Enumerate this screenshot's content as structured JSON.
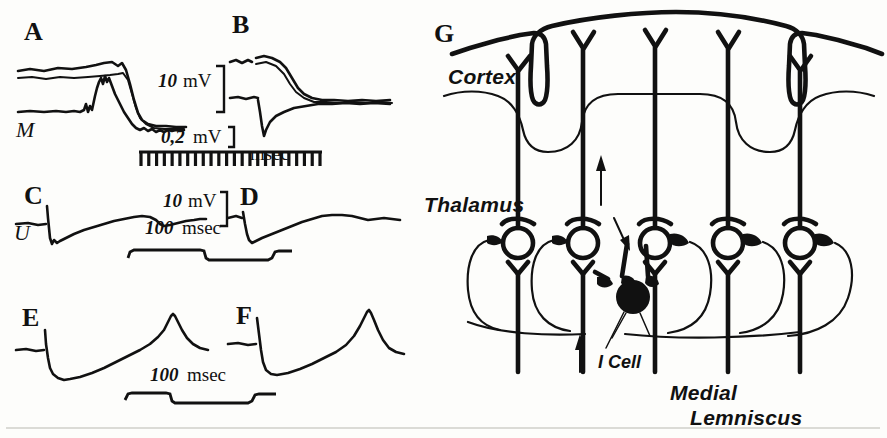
{
  "figure": {
    "kind": "electrophysiology-figure",
    "background_color": "#fdfdfb",
    "ink_color": "#111111"
  },
  "panels": {
    "a": {
      "letter": "A",
      "trace_label": "M"
    },
    "b": {
      "letter": "B"
    },
    "c": {
      "letter": "C",
      "trace_label": "U"
    },
    "d": {
      "letter": "D"
    },
    "e": {
      "letter": "E"
    },
    "f": {
      "letter": "F"
    },
    "g": {
      "letter": "G"
    }
  },
  "scales": {
    "ab_voltage_major": {
      "value": "10",
      "unit": "mV"
    },
    "ab_voltage_minor": {
      "value": "0,2",
      "unit": "mV"
    },
    "ab_time_unit": "msec",
    "ab_time_ticks": 24,
    "cd_voltage": {
      "value": "10",
      "unit": "mV"
    },
    "cd_time": {
      "value": "100",
      "unit": "msec"
    },
    "ef_time": {
      "value": "100",
      "unit": "msec"
    }
  },
  "diagram": {
    "labels": {
      "cortex": "Cortex",
      "thalamus": "Thalamus",
      "icell": "I Cell",
      "lemniscus_line1": "Medial",
      "lemniscus_line2": "Lemniscus"
    },
    "relay_cell_count": 5,
    "sulci_count": 2,
    "arrows": [
      {
        "name": "ascending-cortical-arrow",
        "direction": "up"
      },
      {
        "name": "recurrent-collateral-arrow",
        "direction": "down-left"
      },
      {
        "name": "lemniscal-input-arrow",
        "direction": "up"
      }
    ]
  },
  "chart_data": {
    "type": "line",
    "title": "",
    "xlabel": "",
    "ylabel": "",
    "panels": [
      {
        "id": "A",
        "description": "Superimposed intracellular and surface records; plateau then steep negative-going fall.",
        "series": [
          {
            "name": "upper-trace-1",
            "label": "",
            "points": "plateau at baseline, small rise, sharp fall, low plateau"
          },
          {
            "name": "upper-trace-2",
            "label": "",
            "points": "parallel to trace-1, slightly lower"
          },
          {
            "name": "M",
            "label": "M",
            "points": "flat baseline, spiky hump, decay to low plateau"
          }
        ],
        "voltage_scale": "10 mV",
        "voltage_scale_minor": "0,2 mV",
        "time_unit": "msec"
      },
      {
        "id": "B",
        "description": "Superimposed traces; upper shoulder descends and converges with rising lower trace.",
        "series": [
          {
            "name": "upper-trace",
            "points": "short plateau, shoulder, descent to common level"
          },
          {
            "name": "lower-trace",
            "points": "sharp downward deflection, slow rise, merge"
          }
        ],
        "time_unit": "msec"
      },
      {
        "id": "C",
        "description": "Intracellular record U: stimulus artifact, hyperpolarizing dip, slow ramp recovery.",
        "series": [
          {
            "name": "U",
            "label": "U",
            "points": "artifact spike, dip, slow ramp up, small notch, plateau"
          }
        ],
        "voltage_scale": "10 mV",
        "time_scale": "100 msec"
      },
      {
        "id": "D",
        "description": "Similar record with artifact, dip and slower wavy recovery.",
        "series": [
          {
            "name": "trace",
            "points": "artifact spike, dip, slow ramp, broad wave, decline"
          }
        ],
        "time_scale": "100 msec"
      },
      {
        "id": "E",
        "description": "Baseline, abrupt downward step, slow ramp to a sharp spike, rapid decay.",
        "series": [
          {
            "name": "trace",
            "points": "baseline, step down, ramp, spike, decay"
          }
        ],
        "time_scale": "100 msec"
      },
      {
        "id": "F",
        "description": "Same as E, repeated cycle with sharp spike at end.",
        "series": [
          {
            "name": "trace",
            "points": "baseline, step down, ramp, spike"
          }
        ],
        "time_scale": "100 msec"
      }
    ]
  }
}
